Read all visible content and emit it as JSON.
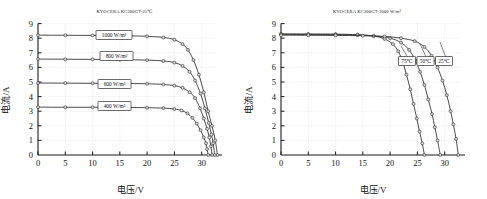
{
  "figures": [
    {
      "id": "left",
      "title": "KYOCERA KC200GT-25℃",
      "xlabel": "电压/V",
      "ylabel": "电流/A"
    },
    {
      "id": "right",
      "title": "KYOCERA KC200GT-1000 W/m²",
      "xlabel": "电压/V",
      "ylabel": "电流/A"
    }
  ],
  "chart_data": [
    {
      "type": "line",
      "title": "KYOCERA KC200GT-25℃",
      "subtitle": "I-V characteristic curves at varying irradiance, cell temperature 25℃",
      "xlabel": "电压/V",
      "ylabel": "电流/A",
      "xlim": [
        0,
        33
      ],
      "ylim": [
        0,
        9
      ],
      "xticks": [
        0,
        5,
        10,
        15,
        20,
        25,
        30
      ],
      "yticks": [
        0,
        1,
        2,
        3,
        4,
        5,
        6,
        7,
        8,
        9
      ],
      "grid": true,
      "legend_position": "inline-callout",
      "markers": "circle",
      "series": [
        {
          "name": "1000 W/m²",
          "label": "1000 W/m²",
          "short_circuit_current": 8.21,
          "open_circuit_voltage": 32.9,
          "x": [
            0,
            5,
            10,
            15,
            20,
            23,
            25,
            26.5,
            27.5,
            28.5,
            29.5,
            30.4,
            31.2,
            31.9,
            32.5,
            32.9
          ],
          "y": [
            8.21,
            8.2,
            8.19,
            8.17,
            8.13,
            8.05,
            7.9,
            7.6,
            7.2,
            6.5,
            5.5,
            4.3,
            3.0,
            2.0,
            1.0,
            0.0
          ]
        },
        {
          "name": "800 W/m²",
          "label": "800 W/m²",
          "short_circuit_current": 6.57,
          "open_circuit_voltage": 32.4,
          "x": [
            0,
            5,
            10,
            15,
            20,
            23,
            25,
            26.5,
            27.8,
            28.8,
            29.8,
            30.6,
            31.3,
            31.8,
            32.1,
            32.4
          ],
          "y": [
            6.57,
            6.56,
            6.55,
            6.53,
            6.5,
            6.44,
            6.33,
            6.1,
            5.7,
            5.1,
            4.2,
            3.2,
            2.2,
            1.4,
            0.8,
            0.0
          ]
        },
        {
          "name": "600 W/m²",
          "label": "600 W/m²",
          "short_circuit_current": 4.93,
          "open_circuit_voltage": 31.9,
          "x": [
            0,
            5,
            10,
            15,
            20,
            23,
            25,
            26.5,
            27.8,
            28.8,
            29.7,
            30.4,
            31.0,
            31.4,
            31.7,
            31.9
          ],
          "y": [
            4.93,
            4.92,
            4.91,
            4.9,
            4.88,
            4.83,
            4.75,
            4.6,
            4.3,
            3.9,
            3.2,
            2.5,
            1.8,
            1.2,
            0.6,
            0.0
          ]
        },
        {
          "name": "400 W/m²",
          "label": "400 W/m²",
          "short_circuit_current": 3.28,
          "open_circuit_voltage": 31.2,
          "x": [
            0,
            5,
            10,
            15,
            20,
            23,
            25,
            26.3,
            27.4,
            28.3,
            29.1,
            29.8,
            30.4,
            30.8,
            31.0,
            31.2
          ],
          "y": [
            3.28,
            3.27,
            3.27,
            3.26,
            3.24,
            3.21,
            3.15,
            3.05,
            2.85,
            2.55,
            2.15,
            1.7,
            1.2,
            0.8,
            0.4,
            0.0
          ]
        }
      ]
    },
    {
      "type": "line",
      "title": "KYOCERA KC200GT-1000 W/m²",
      "subtitle": "I-V characteristic curves at varying cell temperature, irradiance 1000 W/m²",
      "xlabel": "电压/V",
      "ylabel": "电流/A",
      "xlim": [
        0,
        33
      ],
      "ylim": [
        0,
        9
      ],
      "xticks": [
        0,
        5,
        10,
        15,
        20,
        25,
        30
      ],
      "yticks": [
        0,
        1,
        2,
        3,
        4,
        5,
        6,
        7,
        8,
        9
      ],
      "grid": true,
      "legend_position": "inline-callout",
      "markers": "circle",
      "series": [
        {
          "name": "75℃",
          "label": "75℃",
          "short_circuit_current": 8.3,
          "open_circuit_voltage": 26.3,
          "x": [
            0,
            5,
            10,
            14,
            17,
            19,
            20.5,
            21.5,
            22.3,
            23.0,
            23.7,
            24.3,
            24.9,
            25.4,
            25.9,
            26.3
          ],
          "y": [
            8.3,
            8.29,
            8.28,
            8.24,
            8.15,
            7.95,
            7.6,
            7.1,
            6.4,
            5.5,
            4.5,
            3.5,
            2.5,
            1.6,
            0.8,
            0.0
          ]
        },
        {
          "name": "50℃",
          "label": "50℃",
          "short_circuit_current": 8.26,
          "open_circuit_voltage": 29.2,
          "x": [
            0,
            5,
            10,
            14,
            17,
            20,
            22,
            23.5,
            24.6,
            25.5,
            26.3,
            27.0,
            27.7,
            28.2,
            28.7,
            29.2
          ],
          "y": [
            8.26,
            8.25,
            8.24,
            8.21,
            8.15,
            8.0,
            7.7,
            7.2,
            6.5,
            5.7,
            4.8,
            3.8,
            2.8,
            1.9,
            1.0,
            0.0
          ]
        },
        {
          "name": "25℃",
          "label": "25℃",
          "short_circuit_current": 8.21,
          "open_circuit_voltage": 32.5,
          "x": [
            0,
            5,
            10,
            15,
            19,
            22,
            24.5,
            26.3,
            27.6,
            28.7,
            29.6,
            30.4,
            31.1,
            31.6,
            32.1,
            32.5
          ],
          "y": [
            8.21,
            8.2,
            8.19,
            8.17,
            8.12,
            8.0,
            7.8,
            7.4,
            6.8,
            6.0,
            5.1,
            4.1,
            3.0,
            2.1,
            1.1,
            0.0
          ]
        }
      ]
    }
  ]
}
